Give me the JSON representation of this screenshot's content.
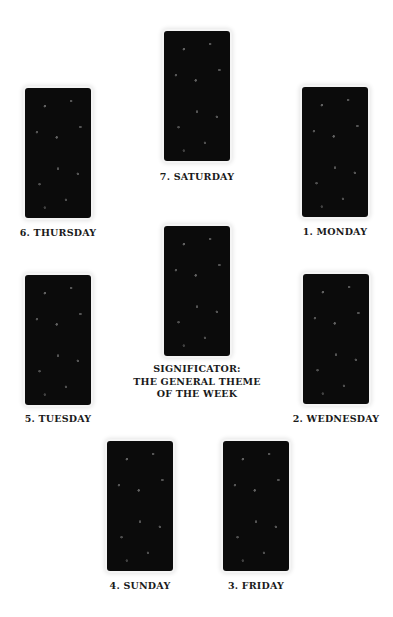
{
  "spread": {
    "positions": [
      {
        "id": "saturday",
        "label": "7. SATURDAY"
      },
      {
        "id": "thursday",
        "label": "6. THURSDAY"
      },
      {
        "id": "monday",
        "label": "1. MONDAY"
      },
      {
        "id": "significator",
        "label_lines": [
          "SIGNIFICATOR:",
          "THE GENERAL THEME",
          "OF THE WEEK"
        ]
      },
      {
        "id": "tuesday",
        "label": "5. TUESDAY"
      },
      {
        "id": "wednesday",
        "label": "2. WEDNESDAY"
      },
      {
        "id": "sunday",
        "label": "4. SUNDAY"
      },
      {
        "id": "friday",
        "label": "3. FRIDAY"
      }
    ]
  },
  "colors": {
    "card_back": "#0b0b0b",
    "label_text": "#1a1a1a",
    "background": "#ffffff"
  }
}
